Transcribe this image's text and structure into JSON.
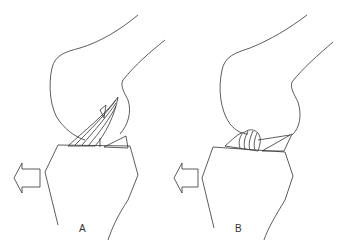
{
  "figure": {
    "panels": [
      {
        "label": "A",
        "description": "Knee joint lateral view with fibrous tissue strands between femoral condyle and tibial plateau, meniscus wedge, anterior drawer arrow"
      },
      {
        "label": "B",
        "description": "Knee joint lateral view with bunched/ruptured tissue mass on tibial plateau, meniscus wedge, anterior drawer arrow"
      }
    ],
    "colors": {
      "line": "#333333",
      "background": "#ffffff"
    },
    "icons": [
      "left-arrow-icon",
      "left-arrow-icon"
    ]
  }
}
